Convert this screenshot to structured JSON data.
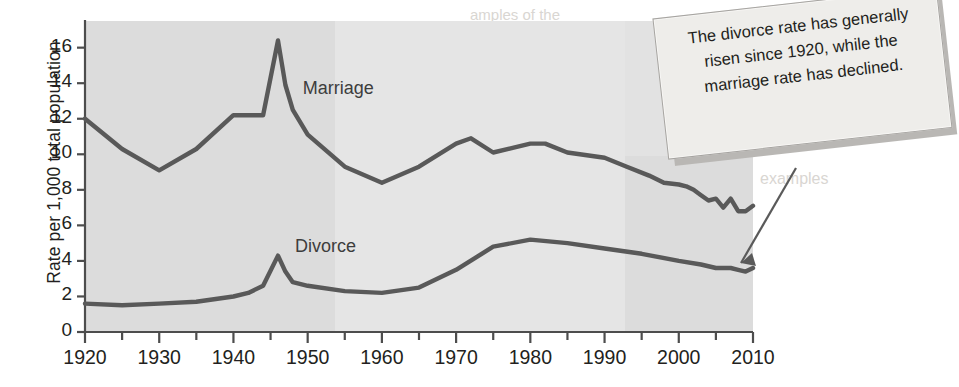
{
  "chart_data": {
    "type": "line",
    "title": "",
    "xlabel": "",
    "ylabel": "Rate per 1,000 total population",
    "xlim": [
      1920,
      2010
    ],
    "ylim": [
      0,
      17.5
    ],
    "xticks": [
      1920,
      1930,
      1940,
      1950,
      1960,
      1970,
      1980,
      1990,
      2000,
      2010
    ],
    "xtick_labels": [
      "1920",
      "1930",
      "1940",
      "1950",
      "1960",
      "1970",
      "1980",
      "1990",
      "2000",
      "2010"
    ],
    "minor_xtick_interval": 5,
    "yticks": [
      0,
      2,
      4,
      6,
      8,
      10,
      12,
      14,
      16
    ],
    "ytick_labels": [
      "0",
      "2",
      "4",
      "6",
      "8",
      "10",
      "12",
      "14",
      "16"
    ],
    "grid": false,
    "legend_position": "inline-labels",
    "series": [
      {
        "name": "Marriage",
        "label_x": 1955,
        "label_y": 13.6,
        "color": "#595959",
        "x": [
          1920,
          1925,
          1930,
          1935,
          1940,
          1942,
          1944,
          1946,
          1947,
          1948,
          1950,
          1955,
          1960,
          1965,
          1970,
          1972,
          1975,
          1980,
          1982,
          1985,
          1990,
          1993,
          1996,
          1998,
          2000,
          2001,
          2002,
          2003,
          2004,
          2005,
          2006,
          2007,
          2008,
          2009,
          2010
        ],
        "values": [
          12.0,
          10.3,
          9.1,
          10.3,
          12.2,
          12.2,
          12.2,
          16.4,
          13.9,
          12.5,
          11.1,
          9.3,
          8.4,
          9.3,
          10.6,
          10.9,
          10.1,
          10.6,
          10.6,
          10.1,
          9.8,
          9.3,
          8.8,
          8.4,
          8.3,
          8.2,
          8.0,
          7.7,
          7.4,
          7.5,
          7.0,
          7.5,
          6.8,
          6.8,
          7.1
        ]
      },
      {
        "name": "Divorce",
        "label_x": 1953,
        "label_y": 4.7,
        "color": "#595959",
        "x": [
          1920,
          1925,
          1930,
          1935,
          1940,
          1942,
          1944,
          1946,
          1947,
          1948,
          1950,
          1955,
          1960,
          1965,
          1970,
          1975,
          1980,
          1985,
          1990,
          1995,
          2000,
          2003,
          2005,
          2007,
          2008,
          2009,
          2010
        ],
        "values": [
          1.6,
          1.5,
          1.6,
          1.7,
          2.0,
          2.2,
          2.6,
          4.3,
          3.4,
          2.8,
          2.6,
          2.3,
          2.2,
          2.5,
          3.5,
          4.8,
          5.2,
          5.0,
          4.7,
          4.4,
          4.0,
          3.8,
          3.6,
          3.6,
          3.5,
          3.4,
          3.6
        ]
      }
    ]
  },
  "callout": {
    "text": "The divorce rate has generally risen since 1920, while the marriage rate has declined.",
    "has_leader_arrow": true,
    "arrow_target_series": "Divorce",
    "arrow_target_year": 2005
  },
  "background_ghost_text": {
    "line1": "amples of the",
    "line2": "examples",
    "line3": "Styles",
    "line4": "of the",
    "line5": "to writing",
    "line6": "out"
  },
  "colors": {
    "plot_background": "#dcdcdc",
    "line": "#595959",
    "axis": "#4d4d4d",
    "text": "#231f20",
    "callout_background": "#eeedea",
    "callout_border": "#a6a4a1",
    "page_background": "#ffffff"
  }
}
